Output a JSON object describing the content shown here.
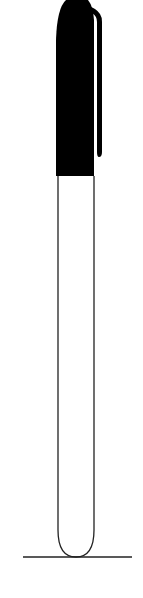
{
  "illustration": {
    "subject": "marker pen with cap standing on a line",
    "colors": {
      "background": "#ffffff",
      "cap": "#000000",
      "outline": "#222222"
    }
  }
}
